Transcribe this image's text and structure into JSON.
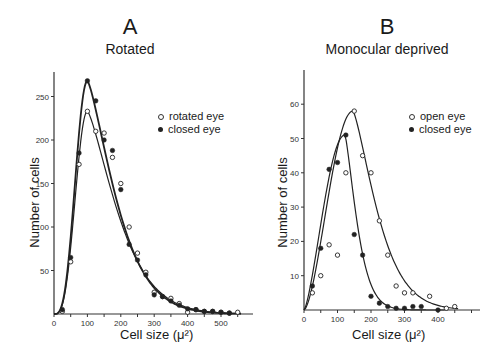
{
  "chart_data": [
    {
      "type": "scatter",
      "panel": "A",
      "title": "Rotated",
      "xlabel": "Cell size (μ²)",
      "ylabel": "Number of cells",
      "xlim": [
        0,
        600
      ],
      "ylim": [
        0,
        275
      ],
      "xticks": [
        0,
        100,
        200,
        300,
        400,
        500
      ],
      "yticks": [
        50,
        100,
        150,
        200,
        250
      ],
      "grid": false,
      "legend_position": "upper right",
      "series": [
        {
          "name": "rotated eye",
          "marker": "open-circle",
          "x": [
            25,
            50,
            75,
            100,
            125,
            150,
            175,
            200,
            225,
            250,
            275,
            300,
            325,
            350,
            375,
            400,
            425,
            450,
            475,
            500,
            525,
            550
          ],
          "y": [
            3,
            60,
            172,
            233,
            210,
            208,
            180,
            150,
            100,
            70,
            48,
            25,
            20,
            18,
            12,
            2,
            5,
            3,
            3,
            2,
            1,
            2
          ],
          "fit_peak": {
            "x": 100,
            "y": 233
          }
        },
        {
          "name": "closed eye",
          "marker": "filled-circle",
          "x": [
            25,
            50,
            75,
            100,
            125,
            150,
            175,
            200,
            225,
            250,
            275,
            300,
            325,
            350,
            375,
            400,
            425,
            450,
            475,
            500,
            525
          ],
          "y": [
            5,
            65,
            185,
            268,
            245,
            200,
            188,
            143,
            80,
            62,
            45,
            22,
            20,
            15,
            10,
            6,
            5,
            3,
            3,
            2,
            1
          ],
          "fit_peak": {
            "x": 100,
            "y": 268
          }
        }
      ]
    },
    {
      "type": "scatter",
      "panel": "B",
      "title": "Monocular deprived",
      "xlabel": "Cell size (μ²)",
      "ylabel": "Number of cells",
      "xlim": [
        0,
        525
      ],
      "ylim": [
        0,
        70
      ],
      "xticks": [
        0,
        100,
        200,
        300,
        400
      ],
      "yticks": [
        10,
        20,
        30,
        40,
        50,
        60
      ],
      "grid": false,
      "legend_position": "upper right",
      "series": [
        {
          "name": "open eye",
          "marker": "open-circle",
          "x": [
            25,
            50,
            75,
            100,
            125,
            150,
            175,
            200,
            225,
            250,
            275,
            300,
            325,
            375,
            425,
            450
          ],
          "y": [
            5,
            10,
            19,
            16,
            40,
            58,
            45,
            40,
            26,
            16,
            7,
            5,
            5,
            4,
            0.5,
            1
          ],
          "fit_peak": {
            "x": 146,
            "y": 58
          }
        },
        {
          "name": "closed eye",
          "marker": "filled-circle",
          "x": [
            25,
            50,
            75,
            100,
            125,
            150,
            175,
            200,
            225,
            250,
            275,
            300,
            325,
            350,
            400
          ],
          "y": [
            7,
            18,
            41,
            43,
            51,
            22,
            16,
            4,
            2,
            1,
            0.5,
            0.5,
            1,
            1,
            0
          ],
          "fit_peak": {
            "x": 122,
            "y": 51
          }
        }
      ]
    }
  ],
  "panels": {
    "a": {
      "letter": "A",
      "title": "Rotated",
      "ylabel": "Number of cells",
      "xlabel": "Cell size (μ²)",
      "legend": [
        "rotated eye",
        "closed eye"
      ]
    },
    "b": {
      "letter": "B",
      "title": "Monocular deprived",
      "ylabel": "Number of cells",
      "xlabel": "Cell size (μ²)",
      "legend": [
        "open eye",
        "closed eye"
      ]
    }
  }
}
